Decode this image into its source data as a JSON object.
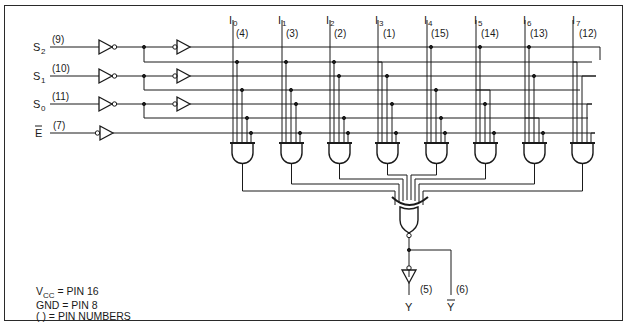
{
  "diagram": {
    "select_inputs": [
      {
        "name": "S",
        "sub": "2",
        "pin": "(9)"
      },
      {
        "name": "S",
        "sub": "1",
        "pin": "(10)"
      },
      {
        "name": "S",
        "sub": "0",
        "pin": "(11)"
      }
    ],
    "enable_input": {
      "name": "E",
      "overbar": true,
      "pin": "(7)"
    },
    "data_inputs": [
      {
        "name": "I",
        "sub": "0",
        "pin": "(4)"
      },
      {
        "name": "I",
        "sub": "1",
        "pin": "(3)"
      },
      {
        "name": "I",
        "sub": "2",
        "pin": "(2)"
      },
      {
        "name": "I",
        "sub": "3",
        "pin": "(1)"
      },
      {
        "name": "I",
        "sub": "4",
        "pin": "(15)"
      },
      {
        "name": "I",
        "sub": "5",
        "pin": "(14)"
      },
      {
        "name": "I",
        "sub": "6",
        "pin": "(13)"
      },
      {
        "name": "I",
        "sub": "7",
        "pin": "(12)"
      }
    ],
    "outputs": [
      {
        "name": "Y",
        "overbar": false,
        "pin": "(5)"
      },
      {
        "name": "Y",
        "overbar": true,
        "pin": "(6)"
      }
    ],
    "notes": {
      "vcc_label": "V",
      "vcc_sub": "CC",
      "vcc_text": " = PIN 16",
      "gnd_text": "GND = PIN 8",
      "pins_text": "(  ) = PIN NUMBERS"
    },
    "colors": {
      "line": "#1a1a1a",
      "background": "#ffffff"
    }
  }
}
